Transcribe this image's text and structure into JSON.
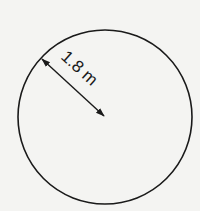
{
  "diagram": {
    "shape": "circle",
    "radius_label": "1.8 m",
    "stroke_color": "#1a1a1a",
    "background_color": "#f4f4f2"
  }
}
